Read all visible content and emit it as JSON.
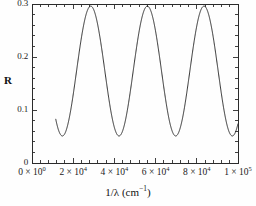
{
  "chart_data": {
    "type": "line",
    "title": "",
    "xlabel": "1/λ (cm⁻¹)",
    "ylabel": "R",
    "xlim": [
      0,
      100000
    ],
    "ylim": [
      0,
      0.3
    ],
    "grid": false,
    "legend": null,
    "xticks": [
      0,
      20000,
      40000,
      60000,
      80000,
      100000
    ],
    "xticklabels": [
      "0 × 10⁰",
      "2 × 10⁴",
      "4 × 10⁴",
      "6 × 10⁴",
      "8 × 10⁴",
      "1 × 10⁵"
    ],
    "yticks": [
      0,
      0.1,
      0.2,
      0.3
    ],
    "yticklabels": [
      "0",
      "0.1",
      "0.2",
      "0.3"
    ],
    "minor_ticks_per_major_x": 4,
    "minor_ticks_per_major_y": 4,
    "line_color": "#2a2a2a",
    "line_width": 1.0,
    "series": [
      {
        "name": "reflectance",
        "x_start": 11500,
        "x_end": 100000,
        "baseline_min": 0.051,
        "peak_max": 0.296,
        "period": 27500,
        "minima_x": [
          18000,
          42000,
          69500,
          98000
        ],
        "minima_y": [
          0.051,
          0.051,
          0.051,
          0.053
        ],
        "maxima_x": [
          28500,
          56000,
          84000
        ],
        "maxima_y": [
          0.296,
          0.296,
          0.296
        ],
        "start_point": [
          11500,
          0.113
        ],
        "end_point": [
          100000,
          0.057
        ]
      }
    ]
  },
  "figure": {
    "y_axis_title": "R",
    "x_axis_title_prefix": "1/λ (cm",
    "x_axis_title_exp": "−1",
    "x_axis_title_suffix": ")"
  }
}
